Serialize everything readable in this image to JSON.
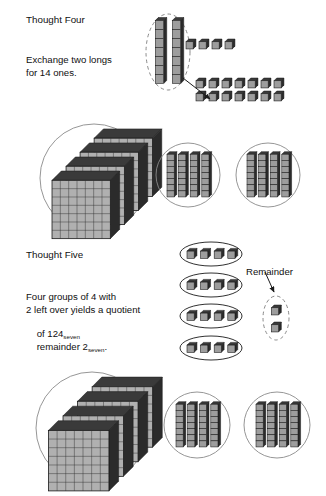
{
  "page": {
    "background": "#ffffff",
    "width": 326,
    "height": 496
  },
  "colors": {
    "outline": "#1a1a1a",
    "ring": "#8a8a8a",
    "dashed": "#7d7d7d",
    "cube_front": "#9d9d9d",
    "cube_top": "#3a3a3a",
    "cube_side": "#2b2b2b",
    "flat_face": "#b0b0b0",
    "flat_grid": "#2f2f2f",
    "text": "#101010",
    "arrow": "#1a1a1a"
  },
  "sections": [
    {
      "id": "thought-four",
      "heading": "Thought Four",
      "body_lines": [
        "Exchange two longs",
        "for 14 ones."
      ],
      "heading_pos": {
        "x": 26,
        "y": 14
      },
      "body_pos": {
        "x": 26,
        "y": 54
      }
    },
    {
      "id": "thought-five",
      "heading": "Thought Five",
      "body_lines": [
        "Four groups of 4 with",
        "2 left over yields a quotient",
        "of 124",
        "remainder 2"
      ],
      "subscript": "seven",
      "trailing_punct": ".",
      "heading_pos": {
        "x": 26,
        "y": 249
      },
      "body_pos": {
        "x": 26,
        "y": 291
      }
    }
  ],
  "labels": [
    {
      "id": "remainder-label",
      "text": "Remainder",
      "x": 246,
      "y": 266
    }
  ],
  "groups": [
    {
      "id": "exchange-source-longs",
      "kind": "dashed-oval",
      "contains": "longs",
      "count": 2,
      "cx": 168,
      "cy": 52,
      "rx": 22,
      "ry": 38
    },
    {
      "id": "top-loose-ones",
      "kind": "loose",
      "contains": "units",
      "count": 4,
      "x": 186,
      "y": 39,
      "gap": 13
    },
    {
      "id": "exchanged-fourteen-ones",
      "kind": "loose-grid",
      "contains": "units",
      "count": 14,
      "rows": 2,
      "cols": 7,
      "x": 196,
      "y": 78,
      "gapx": 13,
      "gapy": 13
    },
    {
      "id": "row1-flats-circle",
      "kind": "circle",
      "contains": "flats",
      "count": 4,
      "cx": 94,
      "cy": 178,
      "r": 54
    },
    {
      "id": "row1-longs-circle-a",
      "kind": "circle",
      "contains": "longs",
      "count": 4,
      "cx": 188,
      "cy": 175,
      "r": 32
    },
    {
      "id": "row1-longs-circle-b",
      "kind": "circle",
      "contains": "longs",
      "count": 4,
      "cx": 268,
      "cy": 175,
      "r": 32
    },
    {
      "id": "group-of-four-ones-1",
      "kind": "oval",
      "contains": "units",
      "count": 4,
      "cx": 211,
      "cy": 254,
      "rx": 31,
      "ry": 12
    },
    {
      "id": "group-of-four-ones-2",
      "kind": "oval",
      "contains": "units",
      "count": 4,
      "cx": 211,
      "cy": 285,
      "rx": 31,
      "ry": 12
    },
    {
      "id": "group-of-four-ones-3",
      "kind": "oval",
      "contains": "units",
      "count": 4,
      "cx": 211,
      "cy": 316,
      "rx": 31,
      "ry": 12
    },
    {
      "id": "group-of-four-ones-4",
      "kind": "oval",
      "contains": "units",
      "count": 4,
      "cx": 211,
      "cy": 348,
      "rx": 31,
      "ry": 12
    },
    {
      "id": "remainder-oval",
      "kind": "dashed-oval",
      "contains": "units",
      "count": 2,
      "cx": 276,
      "cy": 318,
      "rx": 13,
      "ry": 22
    },
    {
      "id": "row2-flats-circle",
      "kind": "circle",
      "contains": "flats",
      "count": 4,
      "cx": 92,
      "cy": 428,
      "r": 56
    },
    {
      "id": "row2-longs-circle-a",
      "kind": "circle",
      "contains": "longs",
      "count": 4,
      "cx": 197,
      "cy": 425,
      "r": 33
    },
    {
      "id": "row2-longs-circle-b",
      "kind": "circle",
      "contains": "longs",
      "count": 4,
      "cx": 277,
      "cy": 425,
      "r": 33
    }
  ],
  "arrows": [
    {
      "id": "exchange-arrow",
      "x1": 183,
      "y1": 78,
      "x2": 210,
      "y2": 99
    },
    {
      "id": "remainder-arrow",
      "x1": 265,
      "y1": 272,
      "x2": 274,
      "y2": 292
    }
  ],
  "block_spec": {
    "base": 7,
    "long_segments": 7,
    "flat_rows": 7,
    "flat_cols": 7,
    "unit_name": "one",
    "long_name": "long",
    "flat_name": "flat"
  }
}
